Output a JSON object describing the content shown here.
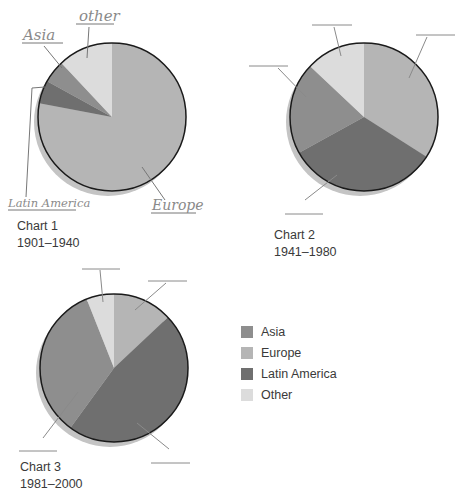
{
  "colors": {
    "Asia": "#8e8e8e",
    "Europe": "#b5b5b5",
    "Latin America": "#6f6f6f",
    "Other": "#dcdcdc",
    "outline": "#1a1a1a",
    "shadow": "#c4c4c4",
    "leader": "#777777"
  },
  "legend": {
    "items": [
      {
        "label": "Asia",
        "color": "#8e8e8e"
      },
      {
        "label": "Europe",
        "color": "#b5b5b5"
      },
      {
        "label": "Latin America",
        "color": "#6f6f6f"
      },
      {
        "label": "Other",
        "color": "#dcdcdc"
      }
    ]
  },
  "charts": [
    {
      "title": "Chart 1",
      "period": "1901–1940",
      "handwritten_labels": [
        "other",
        "Asia",
        "Latin America",
        "Europe"
      ]
    },
    {
      "title": "Chart 2",
      "period": "1941–1980"
    },
    {
      "title": "Chart 3",
      "period": "1981–2000"
    }
  ],
  "chart_data": [
    {
      "type": "pie",
      "title": "Chart 1",
      "subtitle": "1901–1940",
      "categories": [
        "Europe",
        "Latin America",
        "Asia",
        "Other"
      ],
      "values": [
        78,
        5,
        5,
        12
      ],
      "start_angle": "12 o'clock, clockwise",
      "annotations": [
        "other",
        "Asia",
        "Latin America",
        "Europe"
      ]
    },
    {
      "type": "pie",
      "title": "Chart 2",
      "subtitle": "1941–1980",
      "categories": [
        "Europe",
        "Latin America",
        "Asia",
        "Other"
      ],
      "values": [
        34,
        33,
        20,
        13
      ],
      "start_angle": "12 o'clock, clockwise",
      "annotations": [
        "",
        "",
        "",
        ""
      ]
    },
    {
      "type": "pie",
      "title": "Chart 3",
      "subtitle": "1981–2000",
      "categories": [
        "Europe",
        "Latin America",
        "Asia",
        "Other"
      ],
      "values": [
        13,
        47,
        34,
        6
      ],
      "start_angle": "12 o'clock, clockwise",
      "annotations": [
        "",
        "",
        "",
        ""
      ]
    }
  ]
}
